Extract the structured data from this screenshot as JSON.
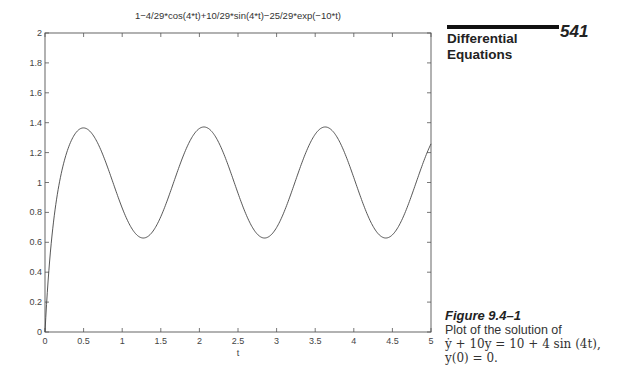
{
  "header": {
    "section_title_line1": "Differential",
    "section_title_line2": "Equations",
    "page_number": "541"
  },
  "caption": {
    "figure_label": "Figure 9.4–1",
    "text": "Plot of the solution of",
    "equation": "ẏ + 10y = 10 + 4 sin (4t),",
    "initial_condition": "y(0) = 0."
  },
  "chart_data": {
    "type": "line",
    "title": "1−4/29*cos(4*t)+10/29*sin(4*t)−25/29*exp(−10*t)",
    "xlabel": "t",
    "ylabel": "",
    "xlim": [
      0,
      5
    ],
    "ylim": [
      0,
      2
    ],
    "xticks": [
      "0",
      "0.5",
      "1",
      "1.5",
      "2",
      "2.5",
      "3",
      "3.5",
      "4",
      "4.5",
      "5"
    ],
    "yticks": [
      "0",
      "0.2",
      "0.4",
      "0.6",
      "0.8",
      "1",
      "1.2",
      "1.4",
      "1.6",
      "1.8",
      "2"
    ],
    "grid": false,
    "legend": null,
    "series": [
      {
        "name": "y(t)",
        "function": "1-4/29*cos(4*t)+10/29*sin(4*t)-25/29*exp(-10*t)",
        "x": [
          0,
          0.1,
          0.2,
          0.3,
          0.4,
          0.5,
          0.6,
          0.7,
          0.8,
          0.9,
          1.0,
          1.1,
          1.2,
          1.3,
          1.4,
          1.5,
          1.6,
          1.7,
          1.8,
          1.9,
          2.0,
          2.1,
          2.2,
          2.3,
          2.4,
          2.5,
          2.6,
          2.7,
          2.8,
          2.9,
          3.0,
          3.1,
          3.2,
          3.3,
          3.4,
          3.5,
          3.6,
          3.7,
          3.8,
          3.9,
          4.0,
          4.1,
          4.2,
          4.3,
          4.4,
          4.5,
          4.6,
          4.7,
          4.8,
          4.9,
          5.0
        ],
        "y": [
          0,
          0.62,
          1.09,
          1.26,
          1.34,
          1.36,
          1.33,
          1.24,
          1.11,
          0.96,
          0.82,
          0.7,
          0.64,
          0.63,
          0.68,
          0.78,
          0.91,
          1.06,
          1.2,
          1.31,
          1.36,
          1.35,
          1.28,
          1.16,
          1.02,
          0.87,
          0.74,
          0.65,
          0.62,
          0.65,
          0.73,
          0.85,
          1.0,
          1.14,
          1.27,
          1.34,
          1.36,
          1.31,
          1.21,
          1.08,
          0.93,
          0.79,
          0.68,
          0.63,
          0.64,
          0.7,
          0.81,
          0.95,
          1.1,
          1.23,
          1.33
        ]
      }
    ]
  }
}
